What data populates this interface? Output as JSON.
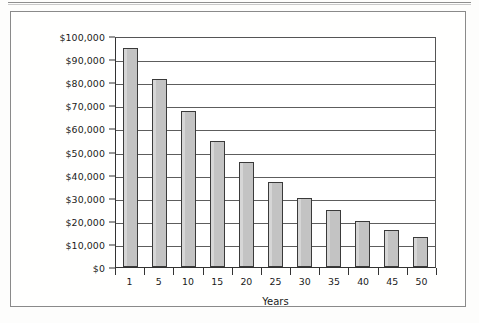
{
  "figure": {
    "axis_title_x": "Years",
    "axis_title_y": "",
    "bar_fill_color": "#c3c3c3",
    "bar_border_color": "#3a3a3a",
    "grid_color": "#5d5d5d",
    "frame_color": "#8a8a8a"
  },
  "chart_data": {
    "type": "bar",
    "title": "",
    "subtitle": "",
    "xlabel": "Years",
    "ylabel": "",
    "categories": [
      "1",
      "5",
      "10",
      "15",
      "20",
      "25",
      "30",
      "35",
      "40",
      "45",
      "50"
    ],
    "values": [
      95000,
      81500,
      67500,
      54500,
      45500,
      37000,
      30000,
      24500,
      20000,
      16000,
      13000
    ],
    "ylim": [
      0,
      100000
    ],
    "ytick_values": [
      0,
      10000,
      20000,
      30000,
      40000,
      50000,
      60000,
      70000,
      80000,
      90000,
      100000
    ],
    "ytick_labels": [
      "$0",
      "$10,000",
      "$20,000",
      "$30,000",
      "$40,000",
      "$50,000",
      "$60,000",
      "$70,000",
      "$80,000",
      "$90,000",
      "$100,000"
    ],
    "xtick_labels": [
      "1",
      "5",
      "10",
      "15",
      "20",
      "25",
      "30",
      "35",
      "40",
      "45",
      "50"
    ],
    "grid": "horizontal",
    "legend": null,
    "legend_position": "none",
    "annotations": []
  }
}
